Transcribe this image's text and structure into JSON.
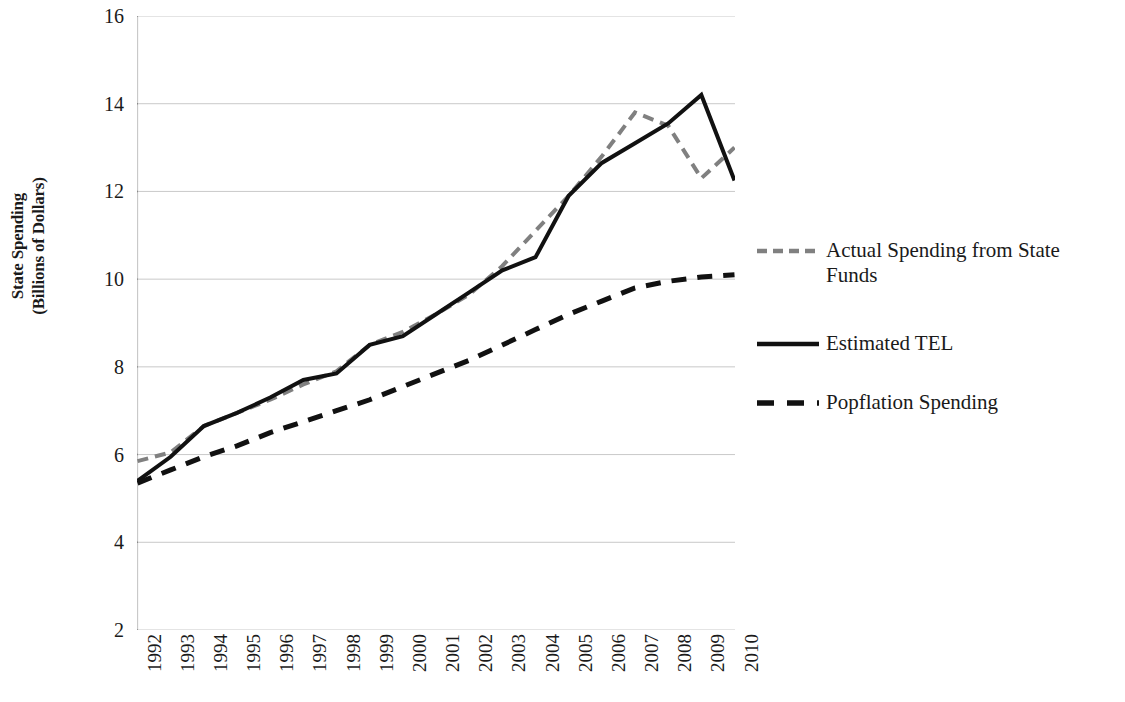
{
  "chart_data": {
    "type": "line",
    "title": "",
    "xlabel": "",
    "ylabel": "State Spending (Billions of Dollars)",
    "ylabel_line1": "State Spending",
    "ylabel_line2": "(Billions of Dollars)",
    "ylim": [
      2,
      16
    ],
    "yticks": [
      2,
      4,
      6,
      8,
      10,
      12,
      14,
      16
    ],
    "ytick_labels": [
      "2",
      "4",
      "6",
      "8",
      "10",
      "12",
      "14",
      "16"
    ],
    "grid": true,
    "legend_position": "right",
    "x": [
      1992,
      1993,
      1994,
      1995,
      1996,
      1997,
      1998,
      1999,
      2000,
      2001,
      2002,
      2003,
      2004,
      2005,
      2006,
      2007,
      2008,
      2009,
      2010
    ],
    "categories": [
      "1992",
      "1993",
      "1994",
      "1995",
      "1996",
      "1997",
      "1998",
      "1999",
      "2000",
      "2001",
      "2002",
      "2003",
      "2004",
      "2005",
      "2006",
      "2007",
      "2008",
      "2009",
      "2010"
    ],
    "series": [
      {
        "name": "Actual Spending from State Funds",
        "style": "dashed",
        "color": "#808080",
        "width": 4,
        "values": [
          5.85,
          6.05,
          6.65,
          6.95,
          7.25,
          7.6,
          7.9,
          8.5,
          8.8,
          9.2,
          9.65,
          10.3,
          11.1,
          11.9,
          12.8,
          13.8,
          13.5,
          12.3,
          13.0
        ]
      },
      {
        "name": "Estimated TEL",
        "style": "solid",
        "color": "#111111",
        "width": 4,
        "values": [
          5.4,
          5.95,
          6.65,
          6.95,
          7.3,
          7.7,
          7.85,
          8.5,
          8.7,
          9.2,
          9.7,
          10.2,
          10.5,
          11.9,
          12.65,
          13.1,
          13.55,
          14.2,
          12.25
        ]
      },
      {
        "name": "Popflation Spending",
        "style": "dashed",
        "color": "#111111",
        "width": 5,
        "values": [
          5.35,
          5.65,
          5.95,
          6.2,
          6.5,
          6.75,
          7.0,
          7.25,
          7.55,
          7.85,
          8.15,
          8.5,
          8.85,
          9.2,
          9.5,
          9.8,
          9.95,
          10.05,
          10.1
        ]
      }
    ]
  },
  "legend": {
    "items": [
      {
        "label": "Actual Spending from State Funds",
        "sample": "gray-dashed-line-sample"
      },
      {
        "label": "Estimated TEL",
        "sample": "black-solid-line-sample"
      },
      {
        "label": "Popflation Spending",
        "sample": "black-dashed-line-sample"
      }
    ]
  },
  "colors": {
    "axis": "#4a4a4a",
    "grid": "#c9c9c9",
    "actual": "#808080",
    "estimated": "#111111",
    "population": "#111111",
    "text": "#1a1a1a"
  }
}
